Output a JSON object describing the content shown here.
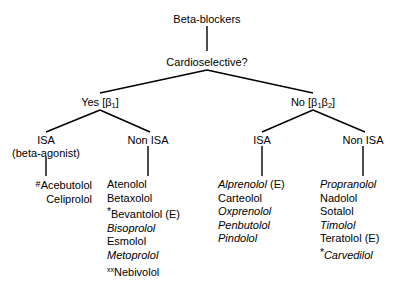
{
  "diagram": {
    "type": "decision-tree",
    "title": "Beta-blockers",
    "root": {
      "label": "Beta-blockers"
    },
    "question": {
      "label": "Cardioselective?"
    },
    "branches": [
      {
        "id": "yes",
        "answer": "Yes",
        "bracket_open": "[",
        "receptor": "β",
        "receptor_sub": "1",
        "bracket_close": "]"
      },
      {
        "id": "no",
        "answer": "No",
        "bracket_open": "[",
        "receptor": "β",
        "receptor_sub": "1",
        "receptor2": "β",
        "receptor2_sub": "2",
        "bracket_close": "]"
      }
    ],
    "subnodes": {
      "yes_isa": {
        "label": "ISA",
        "sublabel": "(beta-agonist)"
      },
      "yes_non_isa": {
        "label": "Non ISA"
      },
      "no_isa": {
        "label": "ISA"
      },
      "no_non_isa": {
        "label": "Non ISA"
      }
    },
    "columns": [
      {
        "id": "yes-isa-drugs",
        "parent": "ISA (beta-agonist)",
        "align": "right",
        "drugs": [
          {
            "marker": "#",
            "marker_style": "hash",
            "name": "Acebutolol",
            "italic": false,
            "suffix": ""
          },
          {
            "marker": "",
            "marker_style": "",
            "name": "Celiprolol",
            "italic": false,
            "suffix": ""
          }
        ]
      },
      {
        "id": "yes-non-isa-drugs",
        "parent": "Non ISA",
        "align": "left",
        "drugs": [
          {
            "marker": "",
            "marker_style": "",
            "name": "Atenolol",
            "italic": false,
            "suffix": ""
          },
          {
            "marker": "",
            "marker_style": "",
            "name": "Betaxolol",
            "italic": false,
            "suffix": ""
          },
          {
            "marker": "*",
            "marker_style": "ast",
            "name": "Bevantolol",
            "italic": false,
            "suffix": " (E)"
          },
          {
            "marker": "",
            "marker_style": "",
            "name": "Bisoprolol",
            "italic": true,
            "suffix": ""
          },
          {
            "marker": "",
            "marker_style": "",
            "name": "Esmolol",
            "italic": false,
            "suffix": ""
          },
          {
            "marker": "",
            "marker_style": "",
            "name": "Metoprolol",
            "italic": true,
            "suffix": ""
          },
          {
            "marker": "xx",
            "marker_style": "xx",
            "name": "Nebivolol",
            "italic": false,
            "suffix": ""
          }
        ]
      },
      {
        "id": "no-isa-drugs",
        "parent": "ISA",
        "align": "left",
        "drugs": [
          {
            "marker": "",
            "marker_style": "",
            "name": "Alprenolol",
            "italic": true,
            "suffix": " (E)"
          },
          {
            "marker": "",
            "marker_style": "",
            "name": "Carteolol",
            "italic": false,
            "suffix": ""
          },
          {
            "marker": "",
            "marker_style": "",
            "name": "Oxprenolol",
            "italic": true,
            "suffix": ""
          },
          {
            "marker": "",
            "marker_style": "",
            "name": "Penbutolol",
            "italic": true,
            "suffix": ""
          },
          {
            "marker": "",
            "marker_style": "",
            "name": "Pindolol",
            "italic": true,
            "suffix": ""
          }
        ]
      },
      {
        "id": "no-non-isa-drugs",
        "parent": "Non ISA",
        "align": "left",
        "drugs": [
          {
            "marker": "",
            "marker_style": "",
            "name": "Propranolol",
            "italic": true,
            "suffix": ""
          },
          {
            "marker": "",
            "marker_style": "",
            "name": "Nadolol",
            "italic": false,
            "suffix": ""
          },
          {
            "marker": "",
            "marker_style": "",
            "name": "Sotalol",
            "italic": false,
            "suffix": ""
          },
          {
            "marker": "",
            "marker_style": "",
            "name": "Timolol",
            "italic": true,
            "suffix": ""
          },
          {
            "marker": "",
            "marker_style": "",
            "name": "Teratolol",
            "italic": false,
            "suffix": " (E)"
          },
          {
            "marker": "*",
            "marker_style": "ast",
            "name": "Carvedilol",
            "italic": true,
            "suffix": ""
          }
        ]
      }
    ],
    "colors": {
      "line": "#000000",
      "text": "#000000",
      "background": "#ffffff"
    }
  }
}
